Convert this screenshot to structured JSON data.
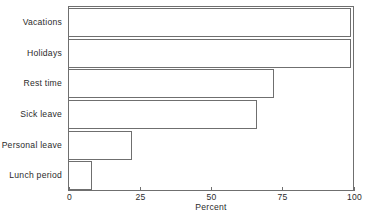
{
  "chart_data": {
    "type": "bar",
    "orientation": "horizontal",
    "title": "",
    "xlabel": "Percent",
    "ylabel": "",
    "categories": [
      "Vacations",
      "Holidays",
      "Rest time",
      "Sick leave",
      "Personal leave",
      "Lunch period"
    ],
    "values": [
      99,
      99,
      72,
      66,
      22,
      8
    ],
    "xlim": [
      0,
      100
    ],
    "xticks": [
      0,
      25,
      50,
      75,
      100
    ],
    "xtick_labels": [
      "0",
      "25",
      "50",
      "75",
      "100"
    ],
    "grid": false,
    "legend": null,
    "bar_fill_color": "#ffffff",
    "bar_outline_color": "#6f6f6f",
    "axis_color": "#6f6f6f",
    "background_color": "#ffffff",
    "text_color": "#2b2b2b"
  }
}
